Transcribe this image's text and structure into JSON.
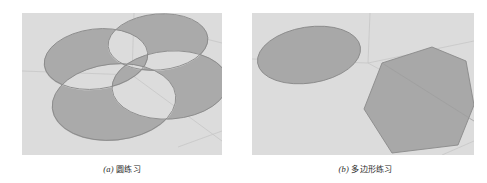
{
  "figure": {
    "background_color": "#ffffff",
    "panel_background_color": "#dcdcdc",
    "shape_fill_color": "#a8a8a8",
    "shape_stroke_color": "#8a8a8a",
    "guide_line_color": "#c6c6c6"
  },
  "subfigures": [
    {
      "id": "a",
      "label_open": "(",
      "label_letter": "a",
      "label_close": ")",
      "caption_text": "圆练习",
      "full_caption": "（a）圆练习",
      "viewport_name": "circle-exercise-viewport",
      "shapes_description": "four overlapping gray ellipses drawn in perspective with even-odd fill",
      "shape_count": "4",
      "shape_type": "ellipse"
    },
    {
      "id": "b",
      "label_open": "(",
      "label_letter": "b",
      "label_close": ")",
      "caption_text": "多边形练习",
      "full_caption": "（b）多边形练习",
      "viewport_name": "polygon-exercise-viewport",
      "shapes_description": "one gray ellipse at upper left and one gray heptagon at lower right drawn in perspective",
      "shape_count": "2",
      "shape_type": "polygon"
    }
  ]
}
